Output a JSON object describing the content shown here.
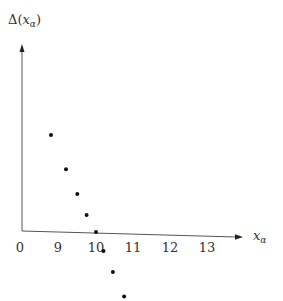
{
  "chart_data": {
    "type": "scatter",
    "title": "",
    "xlabel": "x_α",
    "ylabel": "Δ(x_α)",
    "x_tick_labels": [
      "0",
      "9",
      "10",
      "11",
      "12",
      "13"
    ],
    "x_ticks": [
      8,
      9,
      10,
      11,
      12,
      13
    ],
    "xlim": [
      8,
      13.9
    ],
    "ylim": [
      -1.7,
      4.9
    ],
    "grid": false,
    "legend": "none",
    "points": [
      {
        "x": 8.8,
        "y": 2.55
      },
      {
        "x": 9.2,
        "y": 1.65
      },
      {
        "x": 9.5,
        "y": 1.0
      },
      {
        "x": 9.75,
        "y": 0.45
      },
      {
        "x": 10.0,
        "y": 0.0
      },
      {
        "x": 10.2,
        "y": -0.5
      },
      {
        "x": 10.45,
        "y": -1.05
      },
      {
        "x": 10.75,
        "y": -1.7
      }
    ],
    "axis_labels": {
      "x_main": "x",
      "x_sub": "α",
      "y_prefix": "Δ(",
      "y_main": "x",
      "y_sub": "α",
      "y_suffix": ")"
    }
  }
}
